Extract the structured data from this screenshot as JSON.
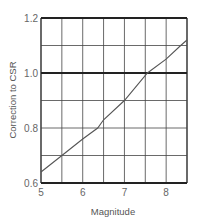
{
  "chart_data": {
    "type": "line",
    "title": "",
    "xlabel": "Magnitude",
    "ylabel": "Correction to CSR",
    "xlim": [
      5,
      8.5
    ],
    "ylim": [
      0.6,
      1.2
    ],
    "x_ticks": [
      "5",
      "6",
      "7",
      "8"
    ],
    "y_ticks": [
      "0.6",
      "0.8",
      "1.0",
      "1.2"
    ],
    "grid": true,
    "x_grid_step": 0.5,
    "y_grid_step": 0.1,
    "reference_line": 1.0,
    "legend": null,
    "series": [
      {
        "name": "Correction",
        "x": [
          5.0,
          5.5,
          6.0,
          6.36,
          6.5,
          7.0,
          7.55,
          8.0,
          8.35,
          8.5
        ],
        "values": [
          0.64,
          0.7,
          0.76,
          0.8,
          0.83,
          0.9,
          1.0,
          1.05,
          1.1,
          1.12
        ]
      }
    ]
  },
  "colors": {
    "grid": "#333333",
    "curve": "#555555",
    "text": "#666666"
  }
}
